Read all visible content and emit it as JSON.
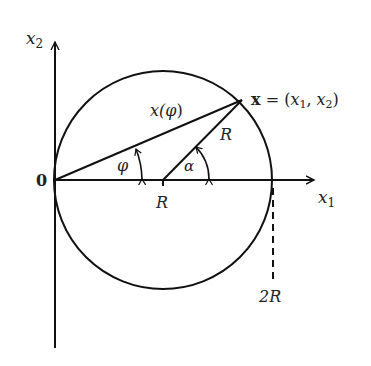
{
  "figure": {
    "background": "#ffffff",
    "stroke_color": "#111111",
    "labels": {
      "x2_axis": "x",
      "x2_axis_sub": "2",
      "x1_axis": "x",
      "x1_axis_sub": "1",
      "origin": "0",
      "phi": "φ",
      "alpha": "α",
      "x_of_phi_prefix": "x(",
      "x_of_phi_var": "φ",
      "x_of_phi_suffix": ")",
      "radius_label": "R",
      "center_label": "R",
      "two_r_label": "2R",
      "point_bold": "x",
      "point_eq": " = (",
      "point_x1": "x",
      "point_x1_sub": "1",
      "point_comma": ", ",
      "point_x2": "x",
      "point_x2_sub": "2",
      "point_close": ")"
    },
    "geometry": {
      "origin_px": [
        55,
        180
      ],
      "circle_center_px": [
        163,
        180
      ],
      "circle_radius_px": 109,
      "point_px": [
        242,
        100
      ]
    }
  }
}
